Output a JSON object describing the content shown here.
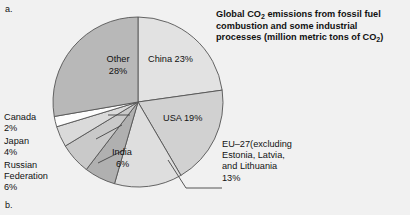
{
  "figure": {
    "letter_a": "a.",
    "letter_b": "b."
  },
  "title": {
    "line1_pre": "Global CO",
    "line1_sub": "2",
    "line1_post": " emissions from fossil fuel",
    "line2": "combustion and some industrial",
    "line3_pre": "processes (million metric tons of CO",
    "line3_sub": "2",
    "line3_post": ")"
  },
  "labels": {
    "china": "China 23%",
    "usa": "USA 19%",
    "other_name": "Other",
    "other_pct": "28%",
    "india_name": "India",
    "india_pct": "6%",
    "canada_name": "Canada",
    "canada_pct": "2%",
    "japan_name": "Japan",
    "japan_pct": "4%",
    "russia_name1": "Russian",
    "russia_name2": "Federation",
    "russia_pct": "6%",
    "eu_line1": "EU–27(excluding",
    "eu_line2": "Estonia, Latvia,",
    "eu_line3": "and Lithuania",
    "eu_line4": "13%"
  },
  "chart_data": {
    "type": "pie",
    "title": "Global CO2 emissions from fossil fuel combustion and some industrial processes (million metric tons of CO2)",
    "unit": "percent of global total",
    "start_angle_deg": 0,
    "direction": "clockwise",
    "categories": [
      "China",
      "USA",
      "EU–27(excluding Estonia, Latvia, and Lithuania",
      "India",
      "Russian Federation",
      "Japan",
      "Canada",
      "Other"
    ],
    "values": [
      23,
      19,
      13,
      6,
      6,
      4,
      2,
      28
    ],
    "colors": [
      "#e2e2e2",
      "#d1d1d1",
      "#dedede",
      "#b0b0b0",
      "#c9c9c9",
      "#dadada",
      "#fdfdfd",
      "#b8b8b8"
    ],
    "legend": "none",
    "labels_inside": [
      "China",
      "USA",
      "Other",
      "India"
    ],
    "labels_callout": [
      "Canada",
      "Japan",
      "Russian Federation",
      "EU–27(excluding Estonia, Latvia, and Lithuania"
    ]
  },
  "colors": {
    "background": "#f1f1f1",
    "outline": "#555555",
    "text": "#111111"
  }
}
